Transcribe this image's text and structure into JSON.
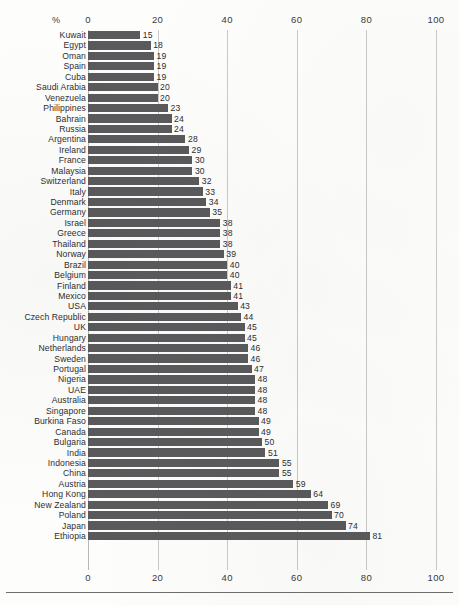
{
  "chart_data": {
    "type": "bar",
    "orientation": "horizontal",
    "title": "",
    "subtitle": "",
    "xlabel": "%",
    "ylabel": "",
    "unit_label": "%",
    "xlim": [
      0,
      100
    ],
    "xticks": [
      0,
      20,
      40,
      60,
      80,
      100
    ],
    "xticklabels": [
      "0",
      "20",
      "40",
      "60",
      "80",
      "100"
    ],
    "grid": true,
    "grid_axis": "x",
    "legend": null,
    "axis_positions": [
      "top",
      "bottom"
    ],
    "bar_color": "#5a5a5c",
    "value_labels_shown": true,
    "categories": [
      "Kuwait",
      "Egypt",
      "Oman",
      "Spain",
      "Cuba",
      "Saudi Arabia",
      "Venezuela",
      "Philippines",
      "Bahrain",
      "Russia",
      "Argentina",
      "Ireland",
      "France",
      "Malaysia",
      "Switzerland",
      "Italy",
      "Denmark",
      "Germany",
      "Israel",
      "Greece",
      "Thailand",
      "Norway",
      "Brazil",
      "Belgium",
      "Finland",
      "Mexico",
      "USA",
      "Czech Republic",
      "UK",
      "Hungary",
      "Netherlands",
      "Sweden",
      "Portugal",
      "Nigeria",
      "UAE",
      "Australia",
      "Singapore",
      "Burkina Faso",
      "Canada",
      "Bulgaria",
      "India",
      "Indonesia",
      "China",
      "Austria",
      "Hong Kong",
      "New Zealand",
      "Poland",
      "Japan",
      "Ethiopia"
    ],
    "values": [
      15,
      18,
      19,
      19,
      19,
      20,
      20,
      23,
      24,
      24,
      28,
      29,
      30,
      30,
      32,
      33,
      34,
      35,
      38,
      38,
      38,
      39,
      40,
      40,
      41,
      41,
      43,
      44,
      45,
      45,
      46,
      46,
      47,
      48,
      48,
      48,
      48,
      49,
      49,
      50,
      51,
      55,
      55,
      59,
      64,
      69,
      70,
      74,
      81
    ]
  }
}
